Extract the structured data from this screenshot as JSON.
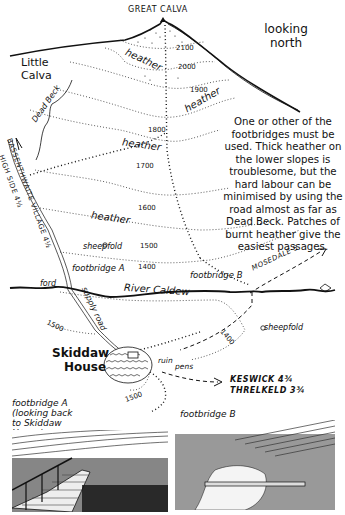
{
  "map": {
    "summit": "GREAT CALVA",
    "orientation": "looking north",
    "peaks": [
      "Little Calva"
    ],
    "streams": {
      "dead_beck": "Dead Beck",
      "river": "River Caldew"
    },
    "vegetation_labels": [
      "heather",
      "heather",
      "heather",
      "heather"
    ],
    "contours": [
      "2100",
      "2000",
      "1900",
      "1800",
      "1700",
      "1600",
      "1500",
      "1400",
      "1500",
      "1400",
      "1500"
    ],
    "features": {
      "sheepfold_1": "sheepfold",
      "sheepfold_2": "sheepfold",
      "footbridge_a": "footbridge A",
      "footbridge_b": "footbridge B",
      "ford": "ford",
      "supply_road": "supply road",
      "skiddaw_house_1": "Skiddaw",
      "skiddaw_house_2": "House",
      "ruin": "ruin",
      "pens": "pens"
    },
    "directions": {
      "high_side": "HIGH SIDE 4½",
      "bassenthwaite": "BASSENTHWAITE VILLAGE 4½",
      "mosedale": "MOSEDALE 5",
      "keswick": "KESWICK 4¾",
      "threlkeld": "THRELKELD 3¾"
    },
    "note": "One or other of the footbridges must be used. Thick heather on the lower slopes is troublesome, but the hard labour can be minimised by using the road almost as far as Dead Beck. Patches of burnt heather give the easiest passages."
  },
  "sketches": {
    "a": {
      "caption_1": "footbridge A",
      "caption_2": "(looking back",
      "caption_3": "to Skiddaw",
      "caption_4": "House)"
    },
    "b": {
      "caption": "footbridge B"
    }
  }
}
